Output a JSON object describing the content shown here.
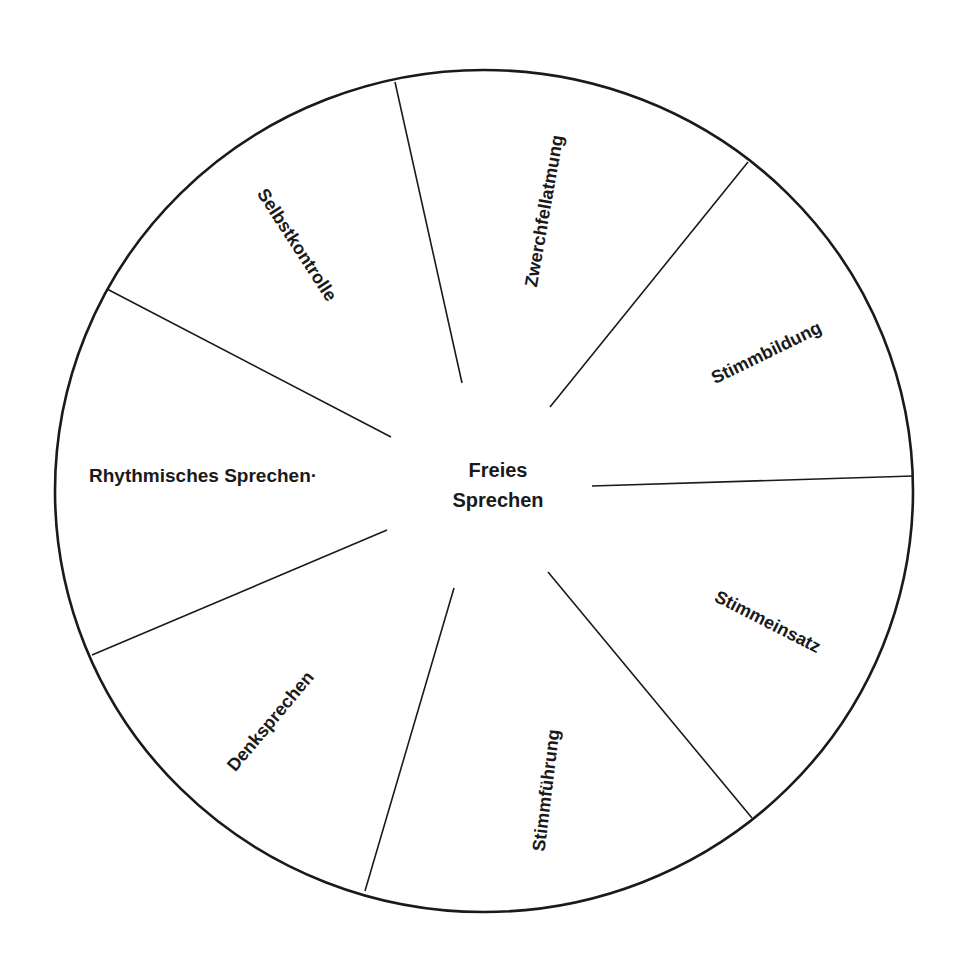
{
  "diagram": {
    "type": "wheel",
    "center": {
      "line1": "Freies",
      "line2": "Sprechen"
    },
    "segments": [
      {
        "label": "Zwerchfellatmung"
      },
      {
        "label": "Stimmbildung"
      },
      {
        "label": "Stimmeinsatz"
      },
      {
        "label": "Stimmführung"
      },
      {
        "label": "Denksprechen"
      },
      {
        "label": "Rhythmisches Sprechen·"
      },
      {
        "label": "Selbstkontrolle"
      }
    ],
    "colors": {
      "line": "#1a1a1a",
      "text": "#1a1a1a",
      "background": "#ffffff"
    }
  }
}
